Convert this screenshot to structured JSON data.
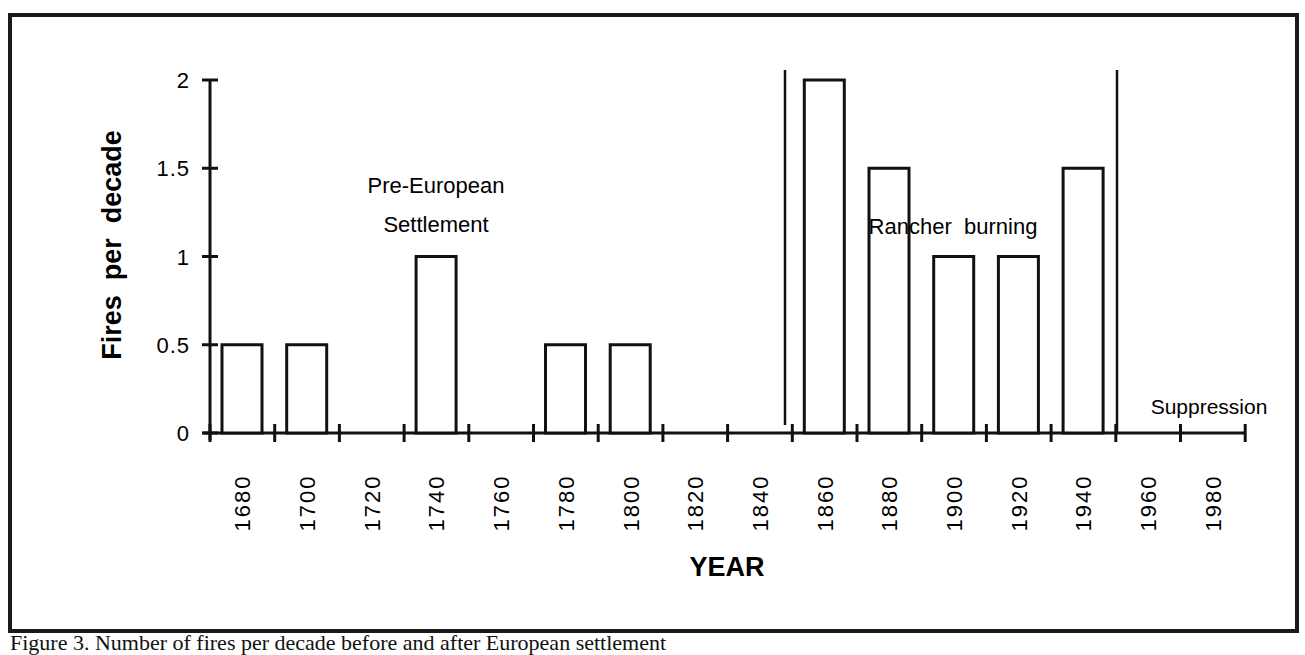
{
  "chart_data": {
    "type": "bar",
    "title": "",
    "xlabel": "YEAR",
    "ylabel": "Fires  per  decade",
    "ylim": [
      0,
      2
    ],
    "yticks": [
      "0",
      "0.5",
      "1",
      "1.5",
      "2"
    ],
    "xtick_labels": [
      "1680",
      "1700",
      "1720",
      "1740",
      "1760",
      "1780",
      "1800",
      "1820",
      "1840",
      "1860",
      "1880",
      "1900",
      "1920",
      "1940",
      "1960",
      "1980"
    ],
    "categories": [
      "1680",
      "1700",
      "1720",
      "1740",
      "1760",
      "1780",
      "1800",
      "1820",
      "1840",
      "1860",
      "1880",
      "1900",
      "1920",
      "1940",
      "1960",
      "1980"
    ],
    "values": [
      0.5,
      0.5,
      0,
      1,
      0,
      0.5,
      0.5,
      0,
      0,
      2,
      1.5,
      1,
      1,
      1.5,
      0,
      0
    ],
    "grid": false,
    "legend": null,
    "annotations": [
      {
        "text_line1": "Pre-European",
        "text_line2": "Settlement",
        "period": "1680-1850"
      },
      {
        "text": "Rancher burning",
        "period": "1850-1950"
      },
      {
        "text": "Suppression",
        "period": "1950-1990"
      }
    ],
    "period_dividers": [
      "~1850",
      "~1950"
    ]
  },
  "labels": {
    "y_axis_title": "Fires  per  decade",
    "x_axis_title": "YEAR",
    "pre_european_line1": "Pre-European",
    "pre_european_line2": "Settlement",
    "rancher": "Rancher  burning",
    "suppression": "Suppression"
  },
  "caption": "Figure 3. Number of fires per decade before and after European settlement"
}
